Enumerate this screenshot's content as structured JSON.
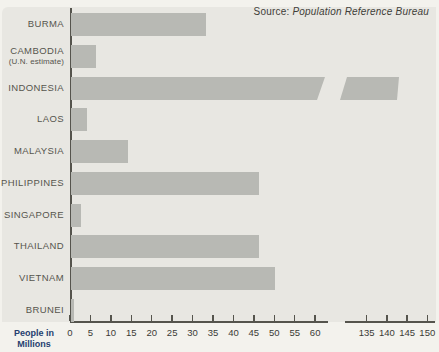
{
  "source": {
    "prefix": "Source:",
    "name": "Population Reference Bureau"
  },
  "axis": {
    "unit_label_line1": "People in",
    "unit_label_line2": "Millions",
    "primary_ticks": [
      0,
      5,
      10,
      15,
      20,
      25,
      30,
      35,
      40,
      45,
      50,
      55,
      60
    ],
    "secondary_ticks": [
      135,
      140,
      145,
      150
    ],
    "break_after": 60,
    "break_resume_at": 135
  },
  "rows": [
    {
      "label_lines": [
        "BURMA"
      ],
      "value": 33
    },
    {
      "label_lines": [
        "CAMBODIA",
        "(U.N. estimate)"
      ],
      "value": 6
    },
    {
      "label_lines": [
        "INDONESIA"
      ],
      "value": 143,
      "broken": true
    },
    {
      "label_lines": [
        "LAOS"
      ],
      "value": 4
    },
    {
      "label_lines": [
        "MALAYSIA"
      ],
      "value": 14
    },
    {
      "label_lines": [
        "PHILIPPINES"
      ],
      "value": 46
    },
    {
      "label_lines": [
        "SINGAPORE"
      ],
      "value": 2.5
    },
    {
      "label_lines": [
        "THAILAND"
      ],
      "value": 46
    },
    {
      "label_lines": [
        "VIETNAM"
      ],
      "value": 50
    },
    {
      "label_lines": [
        "BRUNEI"
      ],
      "value": 0.2
    }
  ],
  "chart_data": {
    "type": "bar",
    "orientation": "horizontal",
    "categories": [
      "BURMA",
      "CAMBODIA (U.N. estimate)",
      "INDONESIA",
      "LAOS",
      "MALAYSIA",
      "PHILIPPINES",
      "SINGAPORE",
      "THAILAND",
      "VIETNAM",
      "BRUNEI"
    ],
    "values": [
      33,
      6,
      143,
      4,
      14,
      46,
      2.5,
      46,
      50,
      0.2
    ],
    "unit": "millions of people",
    "xlabel": "People in Millions",
    "source": "Source: Population Reference Bureau",
    "xticks": [
      0,
      5,
      10,
      15,
      20,
      25,
      30,
      35,
      40,
      45,
      50,
      55,
      60,
      135,
      140,
      145,
      150
    ],
    "axis_break": {
      "after": 60,
      "resume_at": 135
    },
    "broken_bar_category": "INDONESIA",
    "xlim": [
      0,
      150
    ],
    "grid": false,
    "legend": false,
    "title": ""
  },
  "colors": {
    "panel_bg": "#e8e7e2",
    "page_bg": "#f3f2ed",
    "bar_fill": "#b8b9b4",
    "axis": "#55544d",
    "label_text": "#56554e",
    "tick_text": "#3b3b36",
    "unit_label_text": "#26406f"
  }
}
